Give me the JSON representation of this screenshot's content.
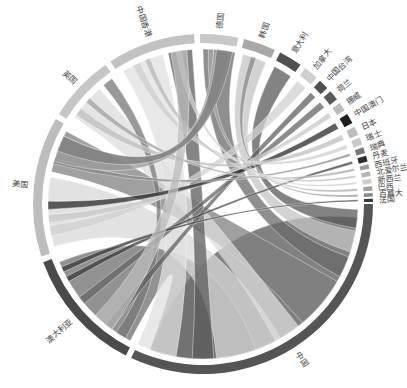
{
  "chart_data": {
    "type": "chord",
    "title": "",
    "center": [
      203,
      204
    ],
    "groups": [
      {
        "name": "中国",
        "start": 90,
        "end": 205,
        "color": "#555555"
      },
      {
        "name": "澳大利亚",
        "start": 207,
        "end": 250,
        "color": "#4a4a4a"
      },
      {
        "name": "美国",
        "start": 252,
        "end": 300,
        "color": "#bdbdbd"
      },
      {
        "name": "英国",
        "start": 302,
        "end": 325,
        "color": "#c6c6c6"
      },
      {
        "name": "中国香港",
        "start": 327,
        "end": 357,
        "color": "#c2c2c2"
      },
      {
        "name": "德国",
        "start": 359,
        "end": 12,
        "color": "#c8c8c8"
      },
      {
        "name": "韩国",
        "start": 14,
        "end": 25,
        "color": "#a8a8a8"
      },
      {
        "name": "意大利",
        "start": 27,
        "end": 35,
        "color": "#505050"
      },
      {
        "name": "加拿大",
        "start": 37,
        "end": 42,
        "color": "#cfcfcf"
      },
      {
        "name": "中国台湾",
        "start": 43.5,
        "end": 47,
        "color": "#4f4f4f"
      },
      {
        "name": "荷兰",
        "start": 48.5,
        "end": 52,
        "color": "#5a5a5a"
      },
      {
        "name": "挪威",
        "start": 53.5,
        "end": 56.5,
        "color": "#bcbcbc"
      },
      {
        "name": "中国澳门",
        "start": 58,
        "end": 61.5,
        "color": "#1e1e1e"
      },
      {
        "name": "日本",
        "start": 63,
        "end": 66,
        "color": "#bdbdbd"
      },
      {
        "name": "瑞士",
        "start": 67,
        "end": 69.5,
        "color": "#c9c9c9"
      },
      {
        "name": "瑞典",
        "start": 70.5,
        "end": 72.5,
        "color": "#777777"
      },
      {
        "name": "丹麦",
        "start": 73.5,
        "end": 75.5,
        "color": "#2d2d2d"
      },
      {
        "name": "西班牙",
        "start": 76.5,
        "end": 78,
        "color": "#9a9a9a"
      },
      {
        "name": "北爱尔兰",
        "start": 79,
        "end": 80.5,
        "color": "#b4b4b4"
      },
      {
        "name": "新西兰",
        "start": 81.5,
        "end": 83,
        "color": "#cccccc"
      },
      {
        "name": "巴西",
        "start": 84,
        "end": 85.5,
        "color": "#a0a0a0"
      },
      {
        "name": "百慕大",
        "start": 86.3,
        "end": 87.5,
        "color": "#8a8a8a"
      },
      {
        "name": "法国",
        "start": 88.2,
        "end": 89.3,
        "color": "#3a3a3a"
      }
    ],
    "ribbons": [
      {
        "a": [
          95,
          200
        ],
        "b": [
          95,
          200
        ],
        "color": "#6b6b6b",
        "self": true
      },
      {
        "a": [
          208,
          248
        ],
        "b": [
          160,
          200
        ],
        "color": "#6e6e6e"
      },
      {
        "a": [
          254,
          280
        ],
        "b": [
          150,
          175
        ],
        "color": "#d8d8d8"
      },
      {
        "a": [
          282,
          298
        ],
        "b": [
          120,
          140
        ],
        "color": "#808080"
      },
      {
        "a": [
          304,
          318
        ],
        "b": [
          142,
          152
        ],
        "color": "#dcdcdc"
      },
      {
        "a": [
          320,
          324
        ],
        "b": [
          210,
          214
        ],
        "color": "#777777"
      },
      {
        "a": [
          329,
          345
        ],
        "b": [
          190,
          205
        ],
        "color": "#e0e0e0"
      },
      {
        "a": [
          347,
          356
        ],
        "b": [
          176,
          184
        ],
        "color": "#5c5c5c"
      },
      {
        "a": [
          360,
          372
        ],
        "b": [
          110,
          118
        ],
        "color": "#6a6a6a"
      },
      {
        "a": [
          15,
          24
        ],
        "b": [
          100,
          108
        ],
        "color": "#c4c4c4"
      },
      {
        "a": [
          27.5,
          34.5
        ],
        "b": [
          92,
          99
        ],
        "color": "#5a5a5a"
      },
      {
        "a": [
          37.5,
          41.5
        ],
        "b": [
          258,
          262
        ],
        "color": "#d0d0d0"
      },
      {
        "a": [
          44,
          46.5
        ],
        "b": [
          216,
          219
        ],
        "color": "#606060"
      },
      {
        "a": [
          49,
          51.5
        ],
        "b": [
          230,
          233
        ],
        "color": "#666666"
      },
      {
        "a": [
          54,
          56
        ],
        "b": [
          263,
          266
        ],
        "color": "#c8c8c8"
      },
      {
        "a": [
          58.5,
          61
        ],
        "b": [
          268,
          271
        ],
        "color": "#2a2a2a"
      },
      {
        "a": [
          63.5,
          65.5
        ],
        "b": [
          305,
          308
        ],
        "color": "#bebebe"
      },
      {
        "a": [
          67.5,
          69
        ],
        "b": [
          333,
          336
        ],
        "color": "#cfcfcf"
      },
      {
        "a": [
          71,
          72
        ],
        "b": [
          285,
          287
        ],
        "color": "#888888"
      },
      {
        "a": [
          74,
          75
        ],
        "b": [
          240,
          242
        ],
        "color": "#3a3a3a"
      },
      {
        "a": [
          76.8,
          77.7
        ],
        "b": [
          311,
          313
        ],
        "color": "#a0a0a0"
      },
      {
        "a": [
          79.3,
          80.2
        ],
        "b": [
          338,
          340
        ],
        "color": "#b8b8b8"
      },
      {
        "a": [
          81.8,
          82.7
        ],
        "b": [
          350,
          352
        ],
        "color": "#cfcfcf"
      },
      {
        "a": [
          84.3,
          85.2
        ],
        "b": [
          2,
          4
        ],
        "color": "#a5a5a5"
      },
      {
        "a": [
          86.5,
          87.3
        ],
        "b": [
          18,
          20
        ],
        "color": "#8a8a8a"
      },
      {
        "a": [
          88.4,
          89.1
        ],
        "b": [
          244,
          246
        ],
        "color": "#3a3a3a"
      },
      {
        "a": [
          286,
          296
        ],
        "b": [
          4,
          10
        ],
        "color": "#9a9a9a"
      },
      {
        "a": [
          348,
          354
        ],
        "b": [
          216,
          224
        ],
        "color": "#bbbbbb"
      },
      {
        "a": [
          5,
          11
        ],
        "b": [
          290,
          296
        ],
        "color": "#7d7d7d"
      }
    ],
    "legend": []
  }
}
